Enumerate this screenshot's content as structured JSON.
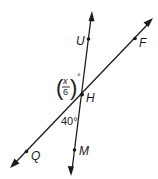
{
  "diagram": {
    "lines": [
      {
        "name": "line-UM",
        "points": [
          "U",
          "H",
          "M"
        ]
      },
      {
        "name": "line-QF",
        "points": [
          "Q",
          "H",
          "F"
        ]
      }
    ],
    "points": {
      "U": "U",
      "F": "F",
      "H": "H",
      "Q": "Q",
      "M": "M"
    },
    "angles": {
      "upper_left": {
        "numerator": "x",
        "denominator": "6",
        "unit": "°",
        "between": "UHQ"
      },
      "lower": {
        "label": "40°",
        "between": "QHM"
      }
    },
    "colors": {
      "stroke": "#1a1a1a",
      "background": "#ffffff"
    }
  }
}
